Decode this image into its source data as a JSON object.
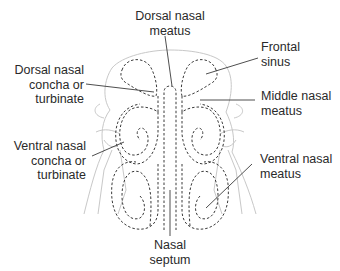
{
  "diagram": {
    "colors": {
      "background": "#ffffff",
      "text": "#2a2a2a",
      "leader_line": "#3a3a3a",
      "dashed_outline": "#3a3a3a",
      "skull_outline": "#c8c8c8"
    },
    "labels": {
      "dorsal_nasal_meatus": [
        "Dorsal nasal",
        "meatus"
      ],
      "frontal_sinus": [
        "Frontal",
        "sinus"
      ],
      "dorsal_nasal_concha": [
        "Dorsal nasal",
        "concha or",
        "turbinate"
      ],
      "middle_nasal_meatus": [
        "Middle nasal",
        "meatus"
      ],
      "ventral_nasal_concha": [
        "Ventral nasal",
        "concha or",
        "turbinate"
      ],
      "ventral_nasal_meatus": [
        "Ventral nasal",
        "meatus"
      ],
      "nasal_septum": [
        "Nasal",
        "septum"
      ]
    }
  }
}
